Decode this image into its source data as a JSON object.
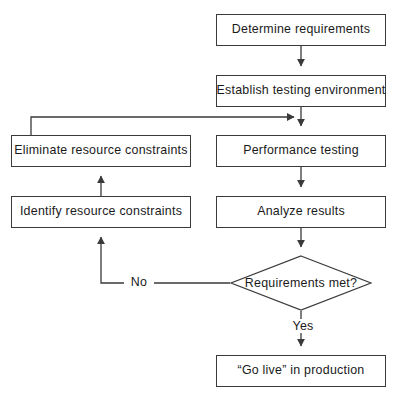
{
  "diagram": {
    "type": "flowchart",
    "canvas": {
      "width": 397,
      "height": 396
    },
    "style": {
      "background": "#ffffff",
      "node_fill": "#ffffff",
      "node_border": "#3a3a3a",
      "line_color": "#3a3a3a",
      "text_color": "#1a1a1a"
    },
    "nodes": [
      {
        "id": "determine_requirements",
        "label": "Determine requirements",
        "shape": "rectangle",
        "x": 216,
        "y": 14,
        "w": 170,
        "h": 32
      },
      {
        "id": "establish_testing_environment",
        "label": "Establish testing environment",
        "shape": "rectangle",
        "x": 216,
        "y": 75,
        "w": 170,
        "h": 32
      },
      {
        "id": "performance_testing",
        "label": "Performance testing",
        "shape": "rectangle",
        "x": 216,
        "y": 135,
        "w": 170,
        "h": 32
      },
      {
        "id": "analyze_results",
        "label": "Analyze results",
        "shape": "rectangle",
        "x": 216,
        "y": 196,
        "w": 170,
        "h": 32
      },
      {
        "id": "requirements_met",
        "label": "Requirements met?",
        "shape": "diamond",
        "x": 230,
        "y": 255,
        "w": 142,
        "h": 56
      },
      {
        "id": "go_live_in_production",
        "label": "“Go live” in production",
        "shape": "rectangle",
        "x": 216,
        "y": 355,
        "w": 170,
        "h": 32
      },
      {
        "id": "eliminate_resource_constraints",
        "label": "Eliminate resource constraints",
        "shape": "rectangle",
        "x": 11,
        "y": 135,
        "w": 180,
        "h": 32
      },
      {
        "id": "identify_resource_constraints",
        "label": "Identify resource constraints",
        "shape": "rectangle",
        "x": 11,
        "y": 196,
        "w": 180,
        "h": 32
      }
    ],
    "edges": [
      {
        "id": "e1",
        "from": "determine_requirements",
        "to": "establish_testing_environment",
        "label": ""
      },
      {
        "id": "e2",
        "from": "establish_testing_environment",
        "to": "performance_testing",
        "label": ""
      },
      {
        "id": "e3",
        "from": "performance_testing",
        "to": "analyze_results",
        "label": ""
      },
      {
        "id": "e4",
        "from": "analyze_results",
        "to": "requirements_met",
        "label": ""
      },
      {
        "id": "e5",
        "from": "requirements_met",
        "to": "go_live_in_production",
        "label": "Yes"
      },
      {
        "id": "e6",
        "from": "requirements_met",
        "to": "identify_resource_constraints",
        "label": "No"
      },
      {
        "id": "e7",
        "from": "identify_resource_constraints",
        "to": "eliminate_resource_constraints",
        "label": ""
      },
      {
        "id": "e8",
        "from": "eliminate_resource_constraints",
        "to": "performance_testing",
        "label": ""
      }
    ],
    "edge_labels": {
      "yes": "Yes",
      "no": "No"
    }
  }
}
